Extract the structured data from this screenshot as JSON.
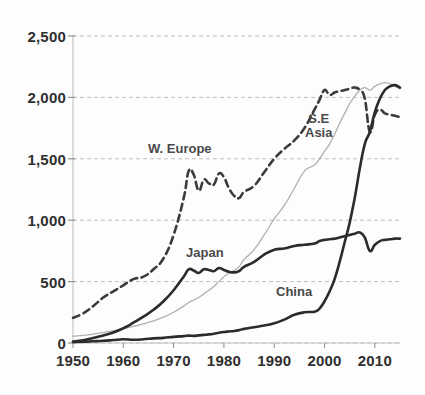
{
  "chart": {
    "type": "line",
    "title": "",
    "xlabel": "",
    "ylabel": "",
    "background_color": "#fdfdfd",
    "grid": true,
    "grid_color": "#b9b9b9",
    "legend_position": "inline-annotations"
  },
  "axes": {
    "y_ticks": [
      "0",
      "500",
      "1,000",
      "1,500",
      "2,000",
      "2,500"
    ],
    "y_tick_values": [
      0,
      500,
      1000,
      1500,
      2000,
      2500
    ],
    "y_min": 0,
    "y_max": 2500,
    "x_ticks": [
      "1950",
      "1960",
      "1970",
      "1980",
      "1990",
      "2000",
      "2010"
    ],
    "x_tick_values": [
      1950,
      1960,
      1970,
      1980,
      1990,
      2000,
      2010
    ],
    "x_min": 1950,
    "x_max": 2015
  },
  "labels": {
    "w_europe": "W. Europe",
    "se_asia_line1": "S.E",
    "se_asia_line2": "Asia",
    "japan": "Japan",
    "china": "China"
  },
  "chart_data": {
    "type": "line",
    "title": "",
    "xlabel": "",
    "ylabel": "",
    "xlim": [
      1950,
      2015
    ],
    "ylim": [
      0,
      2500
    ],
    "grid": true,
    "legend_position": "inline-annotations",
    "x": [
      1950,
      1952,
      1954,
      1956,
      1958,
      1960,
      1962,
      1964,
      1966,
      1968,
      1970,
      1972,
      1973,
      1974,
      1975,
      1976,
      1977,
      1978,
      1979,
      1980,
      1981,
      1982,
      1983,
      1984,
      1986,
      1988,
      1990,
      1992,
      1994,
      1996,
      1998,
      1999,
      2000,
      2001,
      2002,
      2003,
      2004,
      2005,
      2006,
      2007,
      2008,
      2009,
      2010,
      2011,
      2012,
      2013,
      2014,
      2015
    ],
    "series": [
      {
        "name": "W. Europe",
        "style": "dashed",
        "color": "#3b3b3b",
        "values": [
          205,
          240,
          300,
          370,
          420,
          470,
          520,
          540,
          600,
          690,
          880,
          1180,
          1400,
          1370,
          1240,
          1330,
          1300,
          1290,
          1380,
          1350,
          1260,
          1200,
          1180,
          1230,
          1280,
          1390,
          1500,
          1580,
          1650,
          1750,
          1900,
          1980,
          2060,
          2020,
          2040,
          2050,
          2060,
          2070,
          2080,
          2060,
          1990,
          1720,
          1860,
          1900,
          1870,
          1860,
          1850,
          1840
        ]
      },
      {
        "name": "S.E Asia",
        "style": "solid-thin",
        "color": "#b0b0b0",
        "values": [
          55,
          62,
          72,
          85,
          98,
          115,
          135,
          155,
          180,
          210,
          250,
          300,
          330,
          350,
          370,
          400,
          430,
          460,
          500,
          540,
          570,
          590,
          620,
          680,
          760,
          880,
          1010,
          1120,
          1260,
          1400,
          1450,
          1500,
          1560,
          1620,
          1700,
          1790,
          1870,
          1950,
          2010,
          2060,
          2080,
          2060,
          2090,
          2110,
          2120,
          2110,
          2090,
          2070
        ]
      },
      {
        "name": "Japan",
        "style": "solid-thick",
        "color": "#2b2b2b",
        "values": [
          12,
          22,
          40,
          62,
          85,
          120,
          165,
          215,
          270,
          340,
          430,
          540,
          600,
          590,
          570,
          600,
          595,
          585,
          610,
          595,
          580,
          575,
          585,
          620,
          660,
          720,
          760,
          770,
          790,
          800,
          810,
          830,
          840,
          845,
          850,
          860,
          870,
          880,
          890,
          900,
          860,
          750,
          800,
          830,
          840,
          845,
          850,
          850
        ]
      },
      {
        "name": "China",
        "style": "solid-thick",
        "color": "#2b2b2b",
        "values": [
          8,
          10,
          14,
          18,
          24,
          30,
          26,
          30,
          38,
          42,
          50,
          56,
          60,
          58,
          62,
          66,
          70,
          76,
          84,
          90,
          94,
          98,
          105,
          115,
          128,
          142,
          160,
          190,
          230,
          250,
          255,
          280,
          340,
          420,
          520,
          660,
          820,
          980,
          1180,
          1420,
          1620,
          1720,
          1880,
          1990,
          2060,
          2090,
          2100,
          2080
        ]
      }
    ]
  }
}
